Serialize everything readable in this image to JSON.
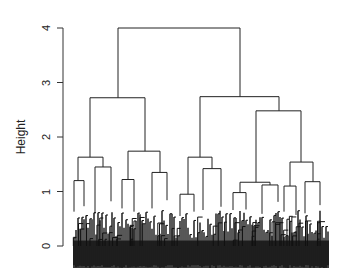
{
  "chart_data": {
    "type": "dendrogram",
    "title": "",
    "xlabel": "",
    "ylabel": "Height",
    "ylim": [
      0,
      4
    ],
    "yticks": [
      0,
      1,
      2,
      3,
      4
    ],
    "grid": false,
    "legend": null,
    "colors": {
      "line": "#222222",
      "axis": "#333333",
      "leaves": "#111111"
    },
    "merges": [
      {
        "id": "root",
        "height": 4.0,
        "x_left": 118,
        "x_right": 240
      },
      {
        "id": "L",
        "height": 2.72,
        "x_left": 90,
        "x_right": 145
      },
      {
        "id": "R",
        "height": 2.74,
        "x_left": 200,
        "x_right": 279
      },
      {
        "id": "LL",
        "height": 1.63,
        "x_left": 78,
        "x_right": 103
      },
      {
        "id": "LR",
        "height": 1.74,
        "x_left": 128,
        "x_right": 160
      },
      {
        "id": "RL",
        "height": 1.63,
        "x_left": 188,
        "x_right": 212
      },
      {
        "id": "RR",
        "height": 2.48,
        "x_left": 256,
        "x_right": 301
      },
      {
        "id": "RRL",
        "height": 1.17,
        "x_left": 240,
        "x_right": 270
      },
      {
        "id": "RRR",
        "height": 1.54,
        "x_left": 290,
        "x_right": 313
      },
      {
        "id": "LLa",
        "height": 1.2,
        "x_left": 74,
        "x_right": 84
      },
      {
        "id": "LLb",
        "height": 1.45,
        "x_left": 95,
        "x_right": 111
      },
      {
        "id": "LRa",
        "height": 1.22,
        "x_left": 122,
        "x_right": 134
      },
      {
        "id": "LRb",
        "height": 1.35,
        "x_left": 152,
        "x_right": 167
      },
      {
        "id": "RLa",
        "height": 0.95,
        "x_left": 180,
        "x_right": 194
      },
      {
        "id": "RLb",
        "height": 1.42,
        "x_left": 203,
        "x_right": 221
      },
      {
        "id": "RRLa",
        "height": 0.98,
        "x_left": 233,
        "x_right": 246
      },
      {
        "id": "RRLb",
        "height": 1.12,
        "x_left": 262,
        "x_right": 278
      },
      {
        "id": "RRRa",
        "height": 1.1,
        "x_left": 284,
        "x_right": 296
      },
      {
        "id": "RRRb",
        "height": 1.18,
        "x_left": 305,
        "x_right": 320
      }
    ],
    "leaves": {
      "x_start": 73,
      "x_end": 329,
      "count": 128,
      "baseline_height": -0.4
    }
  },
  "axis": {
    "tick_labels": [
      "0",
      "1",
      "2",
      "3",
      "4"
    ]
  },
  "labels": {
    "ylabel": "Height"
  }
}
